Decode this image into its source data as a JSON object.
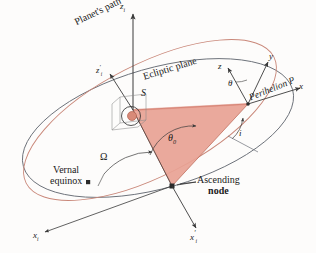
{
  "figure": {
    "background_color": "#fdfcfb"
  },
  "colors": {
    "orbit_path": "#c98779",
    "ecliptic": "#6b7078",
    "axis": "#3a3a3a",
    "shaded_sector": "#e8a294",
    "shaded_sector_edge": "#c0705f",
    "text": "#1a1a1a"
  },
  "labels": {
    "planets_path": "Planet's path",
    "ecliptic_plane": "Ecliptic plane",
    "perihelion": "Perihelion P",
    "vernal_equinox_line1": "Vernal",
    "vernal_equinox_line2": "equinox",
    "ascending_node_line1": "Ascending",
    "ascending_node_line2": "node",
    "sun": "S",
    "angle_theta0": "θ",
    "angle_theta0_sub": "0",
    "angle_omega": "Ω",
    "angle_inclination": "i",
    "angle_argument_perihelion": "θ",
    "axis_zi": "z",
    "axis_zi_sub": "i",
    "axis_zi_prime": "z",
    "axis_zi_prime_sub": "i",
    "axis_xi": "x",
    "axis_xi_sub": "i",
    "axis_xi_prime": "x",
    "axis_xi_prime_sub": "i",
    "axis_x": "x",
    "axis_y": "y",
    "axis_z": "z",
    "prime_mark": "′"
  },
  "elements": {
    "orbit_ellipse": "planet orbital ellipse (reddish)",
    "ecliptic_ellipse": "ecliptic reference ellipse (gray)",
    "shaded_sector": "true anomaly sector between ascending node and perihelion",
    "sun_marker": "small circle at focus S",
    "ascending_node_marker": "filled square node point",
    "vernal_equinox_marker": "filled square equinox point"
  }
}
